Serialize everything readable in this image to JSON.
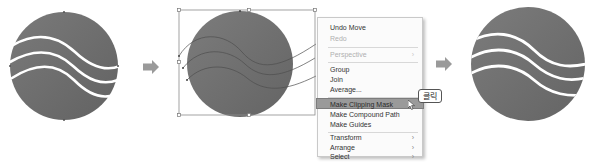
{
  "steps": [
    {
      "id": "before",
      "description": "circle with three white wavy lines"
    },
    {
      "id": "selected",
      "description": "circle and wavy paths selected with bounding box"
    },
    {
      "id": "after",
      "description": "clipping mask applied, waves clipped to circle"
    }
  ],
  "context_menu": {
    "items": [
      {
        "label": "Undo Move",
        "enabled": true
      },
      {
        "label": "Redo",
        "enabled": false
      },
      {
        "label": "Perspective",
        "enabled": false,
        "submenu": true
      },
      {
        "label": "Group",
        "enabled": true
      },
      {
        "label": "Join",
        "enabled": true
      },
      {
        "label": "Average...",
        "enabled": true
      },
      {
        "label": "Make Clipping Mask",
        "enabled": true,
        "highlighted": true
      },
      {
        "label": "Make Compound Path",
        "enabled": true
      },
      {
        "label": "Make Guides",
        "enabled": true
      },
      {
        "label": "Transform",
        "enabled": true,
        "submenu": true
      },
      {
        "label": "Arrange",
        "enabled": true,
        "submenu": true
      },
      {
        "label": "Select",
        "enabled": true,
        "submenu": true
      }
    ],
    "submenu_glyph": "›"
  },
  "click_annotation": "클릭",
  "icons": {
    "arrow": "right-arrow-icon",
    "cursor": "mouse-pointer-icon"
  },
  "colors": {
    "circle_dark": "#6e6e6e",
    "circle_light": "#8a8a8a",
    "wave": "#ffffff",
    "arrow": "#9a9a9a",
    "highlight": "#9a9a9a"
  }
}
